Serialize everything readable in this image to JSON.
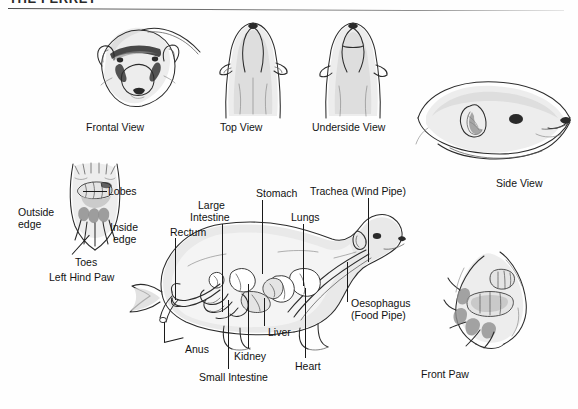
{
  "page": {
    "title": "THE FERRET",
    "background_color": "#fefefe",
    "ink_color": "#1c1c1c"
  },
  "figures": [
    {
      "id": "frontal-view",
      "caption": "Frontal View"
    },
    {
      "id": "top-view",
      "caption": "Top View"
    },
    {
      "id": "underside-view",
      "caption": "Underside View"
    },
    {
      "id": "side-view",
      "caption": "Side View"
    },
    {
      "id": "left-hind-paw",
      "caption": "Left Hind Paw"
    },
    {
      "id": "front-paw",
      "caption": "Front Paw"
    },
    {
      "id": "internal-anatomy",
      "caption": ""
    }
  ],
  "paw_labels": {
    "lobes": "Lobes",
    "outside_edge": "Outside\nedge",
    "outside_edge_line1": "Outside",
    "outside_edge_line2": "edge",
    "inside_edge_line1": "Inside",
    "inside_edge_line2": "edge",
    "toes": "Toes"
  },
  "anatomy_labels": {
    "rectum": "Rectum",
    "large_intestine_line1": "Large",
    "large_intestine_line2": "Intestine",
    "stomach": "Stomach",
    "trachea": "Trachea (Wind Pipe)",
    "lungs": "Lungs",
    "oesophagus_line1": "Oesophagus",
    "oesophagus_line2": "(Food Pipe)",
    "anus": "Anus",
    "kidney": "Kidney",
    "small_intestine": "Small Intestine",
    "liver": "Liver",
    "heart": "Heart"
  }
}
